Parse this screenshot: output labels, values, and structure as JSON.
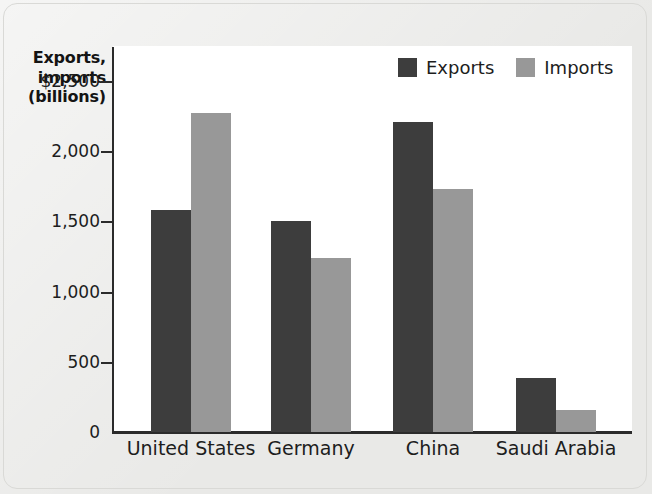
{
  "chart_data": {
    "type": "bar",
    "title": "",
    "xlabel": "",
    "ylabel": "Exports, imports (billions)",
    "ylabel_lines": [
      "Exports,",
      "imports",
      "(billions)"
    ],
    "categories": [
      "United States",
      "Germany",
      "China",
      "Saudi Arabia"
    ],
    "series": [
      {
        "name": "Exports",
        "color": "#3d3d3d",
        "values": [
          1580,
          1500,
          2210,
          385
        ]
      },
      {
        "name": "Imports",
        "color": "#989898",
        "values": [
          2270,
          1240,
          1730,
          155
        ]
      }
    ],
    "ylim": [
      0,
      2750
    ],
    "y_ticks": [
      0,
      500,
      1000,
      1500,
      2000,
      2500
    ],
    "y_tick_labels": [
      "0",
      "500",
      "1,000",
      "1,500",
      "2,000",
      "$2,500"
    ],
    "grid": false,
    "legend_position": "top-right",
    "legend": [
      "Exports",
      "Imports"
    ]
  },
  "legend": {
    "items": [
      {
        "label": "Exports",
        "swatch": "exports"
      },
      {
        "label": "Imports",
        "swatch": "imports"
      }
    ]
  },
  "colors": {
    "exports": "#3d3d3d",
    "imports": "#989898",
    "axis": "#2b2b2b",
    "plot_background": "#ffffff",
    "page_background": "#e9e9e7",
    "text": "#1d1d1d"
  }
}
